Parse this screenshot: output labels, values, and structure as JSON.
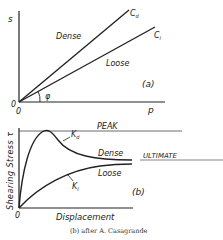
{
  "diagram_a": {
    "y_axis_label": "s",
    "x_axis_label": "p",
    "origin_label_y": "0",
    "origin_label_x": "0",
    "angle_label": "φ",
    "panel_label": "(a)",
    "lines": [
      {
        "label": "C",
        "subscript": "d",
        "region_label": "Dense"
      },
      {
        "label": "C",
        "subscript": "l",
        "region_label": "Loose"
      }
    ]
  },
  "diagram_b": {
    "y_axis_label": "Shearing Stress τ",
    "x_axis_label": "Displacement",
    "origin_label": "0",
    "panel_label": "(b)",
    "peak_label": "PEAK",
    "ultimate_label": "ULTIMATE",
    "curves": [
      {
        "label": "K",
        "subscript": "d",
        "region_label": "Dense"
      },
      {
        "label": "K",
        "subscript": "l",
        "region_label": "Loose"
      }
    ]
  },
  "caption": "(b) after A. Casagrande",
  "colors": {
    "ink": "#222222",
    "background": "#ffffff"
  }
}
